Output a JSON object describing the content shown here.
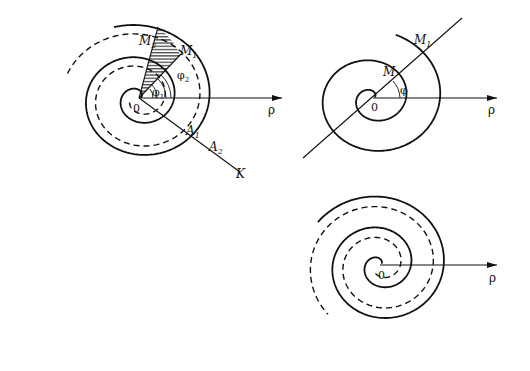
{
  "figure": {
    "background": "#ffffff",
    "stroke_color": "#111111",
    "diagrams": [
      {
        "id": "left",
        "origin": [
          139,
          98
        ],
        "origin_label": "0",
        "axis_label": "ρ",
        "axis_end": [
          282,
          98
        ],
        "labels": {
          "M1": "M",
          "M1_sub": "1",
          "M2": "M",
          "M2_sub": "2",
          "A1": "A",
          "A1_sub": "1",
          "A2": "A",
          "A2_sub": "2",
          "K": "K",
          "phi1": "φ",
          "phi1_sub": "1",
          "phi2": "φ",
          "phi2_sub": "2"
        },
        "hatched_sector": "M2-0-M1"
      },
      {
        "id": "top-right",
        "origin": [
          373,
          98
        ],
        "origin_label": "0",
        "axis_label": "ρ",
        "axis_end": [
          497,
          98
        ],
        "labels": {
          "M": "M",
          "M1": "M",
          "M1_sub": "1",
          "phi": "φ"
        }
      },
      {
        "id": "bottom-right",
        "origin": [
          380,
          265
        ],
        "origin_label": "0",
        "axis_label": "ρ",
        "axis_end": [
          497,
          265
        ]
      }
    ]
  }
}
